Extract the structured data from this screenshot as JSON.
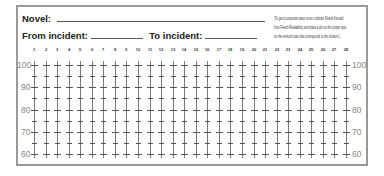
{
  "form": {
    "novel_label": "Novel:",
    "novel_value": "",
    "from_label": "From incident:",
    "from_value": "",
    "to_label": "To incident:",
    "to_value": "",
    "instructions": [
      "(To get a composite pace score, subtract Flesch-Kincaid",
      "from Flesch Readability and place a dot on the proper spot",
      "on the vertical scale that corresponds to the incident.)"
    ]
  },
  "grid": {
    "columns": [
      "1",
      "2",
      "3",
      "4",
      "5",
      "6",
      "7",
      "8",
      "9",
      "10",
      "11",
      "12",
      "13",
      "14",
      "15",
      "16",
      "17",
      "18",
      "19",
      "20",
      "21",
      "22",
      "23",
      "24",
      "25",
      "26",
      "27",
      "28"
    ],
    "scale_labels": [
      "100",
      "90",
      "80",
      "70",
      "60"
    ],
    "scale_min": 60,
    "scale_max": 100,
    "minor_step": 5
  },
  "colors": {
    "border": "#9a9a9a",
    "lines": "#777777",
    "scale_text": "#888888"
  }
}
